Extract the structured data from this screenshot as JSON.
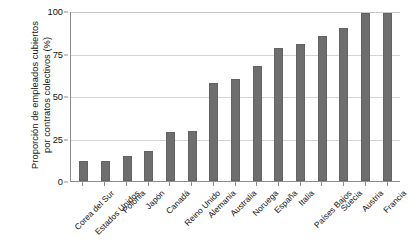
{
  "chart_data": {
    "type": "bar",
    "title": "",
    "subtitle": "",
    "xlabel": "",
    "ylabel": "Proporción de empleados cubiertos por contratos colectivos (%)",
    "ylabel_lines": [
      "Proporción de empleados cubiertos",
      "por contratos colectivos (%)"
    ],
    "categories": [
      "Corea del Sur",
      "Estados Unidos",
      "Polonia",
      "Japón",
      "Canadá",
      "Reino Unido",
      "Alemania",
      "Australia",
      "Noruega",
      "España",
      "Italia",
      "Países Bajos",
      "Suecia",
      "Austria",
      "Francia"
    ],
    "values": [
      11.5,
      12,
      15,
      17.5,
      29,
      29.5,
      57.5,
      60,
      67.5,
      78,
      80.5,
      85.5,
      90,
      99,
      99
    ],
    "ylim": [
      0,
      100
    ],
    "yticks": [
      0,
      25,
      50,
      75,
      100
    ],
    "ytick_labels": [
      "0",
      "25",
      "50",
      "75",
      "100"
    ],
    "grid": true,
    "grid_axis": "y",
    "legend": false,
    "legend_position": "none",
    "bar_color": "#6e6e6e",
    "grid_color": "#d4d4d4",
    "axis_color": "#8c8c8c",
    "background_color": "#ffffff"
  }
}
